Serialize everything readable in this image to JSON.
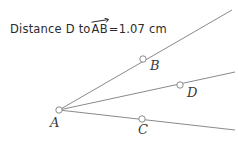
{
  "canvas": {
    "width": 238,
    "height": 143,
    "background": "#ffffff"
  },
  "caption": {
    "prefix": "Distance D to ",
    "ray_term": "AB",
    "ray_arrow_icon": "right-arrow-overbar",
    "equals": " = ",
    "value": "1.07",
    "unit": "cm",
    "full_text": "Distance D to AB = 1.07 cm",
    "color": "#2b2b2b"
  },
  "figure": {
    "stroke_color": "#8a8a8a",
    "stroke_width": 1,
    "point_fill": "#ffffff",
    "point_stroke": "#8a8a8a",
    "point_radius": 3,
    "label_color": "#3a3a3a",
    "vertex": {
      "name": "A",
      "x": 59,
      "y": 110
    },
    "points": [
      {
        "name": "A",
        "x": 59,
        "y": 110,
        "label_x": 50,
        "label_y": 115
      },
      {
        "name": "B",
        "x": 143,
        "y": 59,
        "label_x": 150,
        "label_y": 58
      },
      {
        "name": "C",
        "x": 142,
        "y": 119,
        "label_x": 138,
        "label_y": 122
      },
      {
        "name": "D",
        "x": 180,
        "y": 85,
        "label_x": 187,
        "label_y": 85
      }
    ],
    "rays": [
      {
        "name": "ray-AB",
        "from": "A",
        "through": "B",
        "x1": 59,
        "y1": 110,
        "x2": 232,
        "y2": 10
      },
      {
        "name": "ray-AD",
        "from": "A",
        "through": "D",
        "x1": 59,
        "y1": 110,
        "x2": 235,
        "y2": 72
      },
      {
        "name": "ray-AC",
        "from": "A",
        "through": "C",
        "x1": 59,
        "y1": 110,
        "x2": 235,
        "y2": 130
      }
    ]
  }
}
